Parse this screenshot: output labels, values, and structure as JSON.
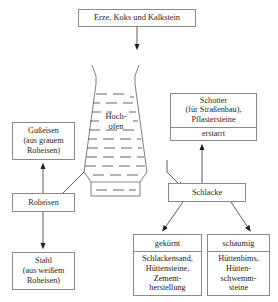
{
  "diagram": {
    "language": "de",
    "stroke_color": "#8a8a8a",
    "text_color": "#1f1f1f",
    "background": "#ffffff"
  },
  "nodes": {
    "input": {
      "label": "Erze, Koks und Kalkstein"
    },
    "furnace": {
      "line1": "Hoch-",
      "line2": "ofen"
    },
    "gusseisen": {
      "line1": "Gußeisen",
      "line2": "(aus grauem",
      "line3": "Roheisen)"
    },
    "roheisen": {
      "label": "Roheisen"
    },
    "stahl": {
      "line1": "Stahl",
      "line2": "(aus weißem",
      "line3": "Roheisen)"
    },
    "schotter": {
      "line1": "Schotter",
      "line2": "(für Straßenbau),",
      "line3": "Pflastersteine",
      "state": "erstarrt"
    },
    "schlacke": {
      "label": "Schlacke"
    },
    "gekoernt": {
      "head": "gekörnt",
      "line1": "Schlackensand,",
      "line2": "Hüttensteine,",
      "line3": "Zement-",
      "line4": "herstellung"
    },
    "schaumig": {
      "head": "schaumig",
      "line1": "Hüttenbims,",
      "line2": "Hütten-",
      "line3": "schwemm-",
      "line4": "steine"
    }
  },
  "connectors": [
    {
      "name": "input-to-furnace",
      "from": "input",
      "to": "furnace",
      "style": "arrow-down"
    },
    {
      "name": "furnace-to-roheisen",
      "from": "furnace",
      "to": "roheisen",
      "style": "elbow"
    },
    {
      "name": "roheisen-to-gusseisen",
      "from": "roheisen",
      "to": "gusseisen",
      "style": "arrow-up"
    },
    {
      "name": "roheisen-to-stahl",
      "from": "roheisen",
      "to": "stahl",
      "style": "arrow-down"
    },
    {
      "name": "furnace-to-schlacke",
      "from": "furnace",
      "to": "schlacke",
      "style": "diagonal-arrow"
    },
    {
      "name": "schlacke-to-schotter",
      "from": "schlacke",
      "to": "schotter",
      "style": "arrow-up"
    },
    {
      "name": "schlacke-to-gekoernt",
      "from": "schlacke",
      "to": "gekoernt",
      "style": "diagonal-arrow"
    },
    {
      "name": "schlacke-to-schaumig",
      "from": "schlacke",
      "to": "schaumig",
      "style": "diagonal-arrow"
    }
  ]
}
